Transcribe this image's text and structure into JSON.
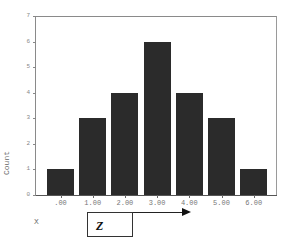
{
  "chart_data": {
    "type": "bar",
    "title": "",
    "xlabel": "X",
    "ylabel": "Count",
    "categories": [
      ".00",
      "1.00",
      "2.00",
      "3.00",
      "4.00",
      "5.00",
      "6.00"
    ],
    "values": [
      1,
      3,
      4,
      6,
      4,
      3,
      1
    ],
    "ylim": [
      0,
      7
    ],
    "yticks": [
      "0",
      "1",
      "2",
      "3",
      "4",
      "5",
      "6",
      "7"
    ],
    "grid": false,
    "legend": null,
    "bar_color": "#2b2b2b"
  },
  "annotation": {
    "box_label": "Z",
    "arrow": "right"
  }
}
